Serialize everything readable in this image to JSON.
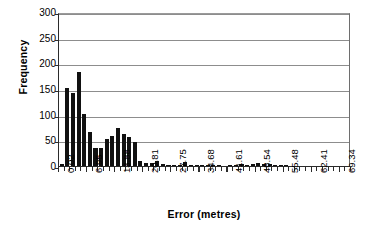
{
  "chart_data": {
    "type": "bar",
    "title": "",
    "xlabel": "Error (metres)",
    "ylabel": "Frequency",
    "ylim": [
      0,
      300
    ],
    "yticks": [
      0,
      50,
      100,
      150,
      200,
      250,
      300
    ],
    "ytick_labels": [
      "0",
      "50",
      "100",
      "150",
      "200",
      "250",
      "300"
    ],
    "grid": "horizontal",
    "legend": "none",
    "bin_width": 1.386,
    "xtick_labels": [
      "0.02",
      "6.95",
      "13.88",
      "20.81",
      "27.75",
      "34.68",
      "41.61",
      "48.54",
      "55.48",
      "62.41",
      "69.34"
    ],
    "xtick_label_interval": 5,
    "categories": [
      "0.02",
      "1.41",
      "2.79",
      "4.18",
      "5.56",
      "6.95",
      "8.34",
      "9.72",
      "11.11",
      "12.49",
      "13.88",
      "15.27",
      "16.65",
      "18.04",
      "19.42",
      "20.81",
      "22.20",
      "23.58",
      "24.97",
      "26.36",
      "27.75",
      "29.13",
      "30.52",
      "31.90",
      "33.29",
      "34.68",
      "36.06",
      "37.45",
      "38.83",
      "40.22",
      "41.61",
      "42.99",
      "44.38",
      "45.76",
      "47.15",
      "48.54",
      "49.92",
      "51.31",
      "52.69",
      "54.08",
      "55.48",
      "56.86",
      "58.25",
      "59.63",
      "61.02",
      "62.41",
      "63.79",
      "65.18",
      "66.56",
      "67.95",
      "69.34",
      "70.72"
    ],
    "values": [
      3,
      152,
      143,
      183,
      102,
      67,
      35,
      35,
      52,
      58,
      74,
      63,
      56,
      47,
      9,
      6,
      6,
      10,
      3,
      1,
      1,
      2,
      7,
      2,
      1,
      1,
      1,
      1,
      1,
      0,
      1,
      2,
      3,
      2,
      4,
      6,
      3,
      4,
      1,
      1,
      1,
      0,
      0,
      0,
      0,
      0,
      0,
      0,
      0,
      0,
      0,
      0
    ]
  }
}
